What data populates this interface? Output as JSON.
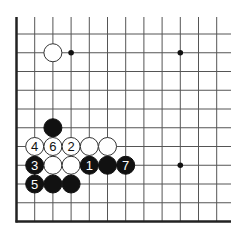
{
  "diagram": {
    "type": "go-board-fragment",
    "view": "lower-left corner",
    "grid": {
      "columns": 12,
      "rows": 11,
      "left_edge": true,
      "bottom_edge": true
    },
    "colors": {
      "line": "#555555",
      "edge": "#222222",
      "black_stone": "#111111",
      "white_stone": "#ffffff",
      "star_point": "#111111"
    },
    "star_points": [
      {
        "col": 3,
        "row": 1
      },
      {
        "col": 9,
        "row": 1
      },
      {
        "col": 9,
        "row": 7
      }
    ],
    "stones": [
      {
        "color": "white",
        "col": 2,
        "row": 1,
        "label": ""
      },
      {
        "color": "black",
        "col": 2,
        "row": 5,
        "label": ""
      },
      {
        "color": "white",
        "col": 1,
        "row": 6,
        "label": "4"
      },
      {
        "color": "white",
        "col": 2,
        "row": 6,
        "label": "6"
      },
      {
        "color": "white",
        "col": 3,
        "row": 6,
        "label": "2"
      },
      {
        "color": "white",
        "col": 4,
        "row": 6,
        "label": ""
      },
      {
        "color": "white",
        "col": 5,
        "row": 6,
        "label": ""
      },
      {
        "color": "black",
        "col": 1,
        "row": 7,
        "label": "3"
      },
      {
        "color": "white",
        "col": 2,
        "row": 7,
        "label": ""
      },
      {
        "color": "white",
        "col": 3,
        "row": 7,
        "label": ""
      },
      {
        "color": "black",
        "col": 4,
        "row": 7,
        "label": "1"
      },
      {
        "color": "black",
        "col": 5,
        "row": 7,
        "label": ""
      },
      {
        "color": "black",
        "col": 6,
        "row": 7,
        "label": "7"
      },
      {
        "color": "black",
        "col": 1,
        "row": 8,
        "label": "5"
      },
      {
        "color": "black",
        "col": 2,
        "row": 8,
        "label": ""
      },
      {
        "color": "black",
        "col": 3,
        "row": 8,
        "label": ""
      }
    ]
  }
}
